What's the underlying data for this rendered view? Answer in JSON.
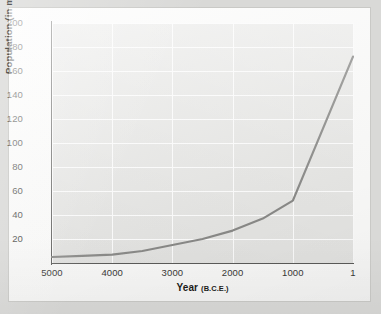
{
  "chart_data": {
    "type": "line",
    "title": "",
    "xlabel": "Year",
    "xlabel_unit": "(B.C.E.)",
    "ylabel": "Population (in millions)",
    "x": [
      5000,
      4500,
      4000,
      3500,
      3000,
      2500,
      2000,
      1500,
      1000,
      1
    ],
    "values": [
      5,
      6,
      7,
      10,
      15,
      20,
      27,
      37,
      52,
      172
    ],
    "series": [
      {
        "name": "World population",
        "color": "#8a8a88",
        "values": [
          5,
          6,
          7,
          10,
          15,
          20,
          27,
          37,
          52,
          172
        ]
      }
    ],
    "xticks": [
      "5000",
      "4000",
      "3000",
      "2000",
      "1000",
      "1"
    ],
    "xtick_values": [
      5000,
      4000,
      3000,
      2000,
      1000,
      1
    ],
    "yticks": [
      "20",
      "40",
      "60",
      "80",
      "100",
      "120",
      "140",
      "160",
      "180",
      "200"
    ],
    "ytick_values": [
      20,
      40,
      60,
      80,
      100,
      120,
      140,
      160,
      180,
      200
    ],
    "xlim": [
      5000,
      1
    ],
    "ylim": [
      0,
      200
    ],
    "x_axis_reversed": true,
    "grid": true,
    "grid_color": "#fdfdfd",
    "legend": "none",
    "plot_background": "#e7e7e5",
    "axis_color": "#5c5c5a",
    "annotations": []
  }
}
